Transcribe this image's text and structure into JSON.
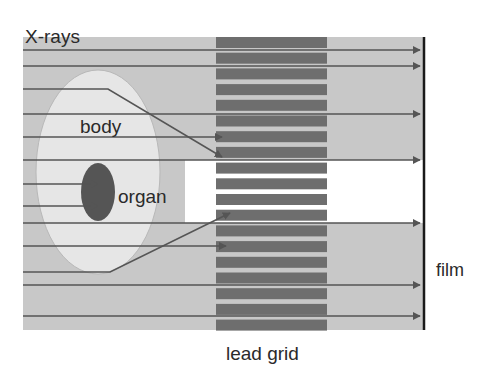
{
  "labels": {
    "xrays": "X-rays",
    "body": "body",
    "organ": "organ",
    "film": "film",
    "lead_grid": "lead grid"
  },
  "colors": {
    "background": "#ffffff",
    "beam_region": "#c8c8c8",
    "body": "#e6e6e6",
    "organ": "#555555",
    "grid_bar": "#6e6e6e",
    "ray": "#555555",
    "film": "#1a1a1a",
    "text": "#2a2a2a"
  },
  "geometry": {
    "beam_region": {
      "x": 23,
      "y": 37,
      "width": 400,
      "height": 293
    },
    "shadow_band": {
      "x": 185,
      "y": 160,
      "width": 238,
      "height": 63
    },
    "body_ellipse": {
      "cx": 98,
      "cy": 172,
      "rx": 62,
      "ry": 102
    },
    "organ_ellipse": {
      "cx": 98,
      "cy": 192,
      "rx": 17,
      "ry": 29
    },
    "lead_grid": {
      "x": 216,
      "y": 37,
      "width": 111,
      "bar_height": 11,
      "pitch": 15.7,
      "count": 19
    },
    "film": {
      "x": 424,
      "y1": 37,
      "y2": 330
    }
  },
  "rays": [
    {
      "id": "ray-1",
      "type": "transmitted",
      "points": [
        [
          23,
          50
        ],
        [
          420,
          50
        ]
      ]
    },
    {
      "id": "ray-2",
      "type": "transmitted",
      "points": [
        [
          23,
          66
        ],
        [
          420,
          66
        ]
      ]
    },
    {
      "id": "ray-3",
      "type": "scattered",
      "points": [
        [
          23,
          89
        ],
        [
          108,
          89
        ],
        [
          222,
          157
        ]
      ]
    },
    {
      "id": "ray-4",
      "type": "transmitted",
      "points": [
        [
          23,
          114
        ],
        [
          420,
          114
        ]
      ]
    },
    {
      "id": "ray-5",
      "type": "absorbed",
      "points": [
        [
          23,
          137
        ],
        [
          222,
          137
        ]
      ]
    },
    {
      "id": "ray-6",
      "type": "transmitted",
      "points": [
        [
          23,
          160
        ],
        [
          420,
          160
        ]
      ]
    },
    {
      "id": "ray-7",
      "type": "organ-absorbed",
      "points": [
        [
          23,
          184
        ],
        [
          98,
          184
        ]
      ]
    },
    {
      "id": "ray-8",
      "type": "organ-absorbed",
      "points": [
        [
          23,
          206
        ],
        [
          98,
          206
        ]
      ]
    },
    {
      "id": "ray-9",
      "type": "transmitted",
      "points": [
        [
          23,
          223
        ],
        [
          420,
          223
        ]
      ]
    },
    {
      "id": "ray-10",
      "type": "absorbed",
      "points": [
        [
          23,
          246
        ],
        [
          226,
          246
        ]
      ]
    },
    {
      "id": "ray-11",
      "type": "scattered",
      "points": [
        [
          23,
          272
        ],
        [
          110,
          272
        ],
        [
          230,
          213
        ]
      ]
    },
    {
      "id": "ray-12",
      "type": "transmitted",
      "points": [
        [
          23,
          285
        ],
        [
          420,
          285
        ]
      ]
    },
    {
      "id": "ray-13",
      "type": "transmitted",
      "points": [
        [
          23,
          316
        ],
        [
          420,
          316
        ]
      ]
    }
  ]
}
